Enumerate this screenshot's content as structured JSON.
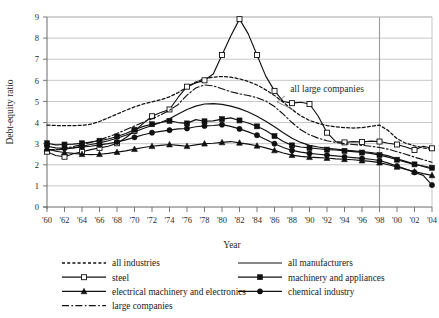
{
  "chart_data": {
    "type": "line",
    "title": "",
    "xlabel": "Year",
    "ylabel": "Debt-equity ratio",
    "xlim": [
      1960,
      2004
    ],
    "ylim": [
      0,
      9
    ],
    "ytick_values": [
      0,
      1,
      2,
      3,
      4,
      5,
      6,
      7,
      8,
      9
    ],
    "ytick_labels": [
      "0",
      "1",
      "2",
      "3",
      "4",
      "5",
      "6",
      "7",
      "8",
      "9"
    ],
    "grid": "horizontal",
    "legend_position": "below-plot",
    "x": [
      1960,
      1961,
      1962,
      1963,
      1964,
      1965,
      1966,
      1967,
      1968,
      1969,
      1970,
      1971,
      1972,
      1973,
      1974,
      1975,
      1976,
      1977,
      1978,
      1979,
      1980,
      1981,
      1982,
      1983,
      1984,
      1985,
      1986,
      1987,
      1988,
      1989,
      1990,
      1991,
      1992,
      1993,
      1994,
      1995,
      1996,
      1997,
      1998,
      1999,
      2000,
      2001,
      2002,
      2003,
      2004
    ],
    "xtick_labels": [
      "'60",
      "'62",
      "'64",
      "'66",
      "'68",
      "'70",
      "'72",
      "'74",
      "'76",
      "'78",
      "'80",
      "'82",
      "'84",
      "'86",
      "'88",
      "'90",
      "'92",
      "'94",
      "'96",
      "'98",
      "'00",
      "'02",
      "'04"
    ],
    "annotations": [
      {
        "text": "all large companies",
        "x": 1992,
        "y": 5.45,
        "points_to_x": 1988.2,
        "points_to_y": 4.6
      }
    ],
    "vertical_line": {
      "x": 1998,
      "label": "1998"
    },
    "series": [
      {
        "name": "all industries",
        "style": "dotted",
        "marker": "none",
        "color": "#111111",
        "values": [
          3.88,
          3.86,
          3.85,
          3.85,
          3.87,
          3.92,
          4.05,
          4.22,
          4.4,
          4.58,
          4.74,
          4.88,
          4.98,
          5.08,
          5.22,
          5.42,
          5.68,
          5.92,
          6.08,
          6.15,
          6.18,
          6.15,
          6.07,
          5.95,
          5.78,
          5.55,
          5.28,
          4.96,
          4.62,
          4.32,
          4.1,
          3.96,
          3.86,
          3.8,
          3.76,
          3.74,
          3.76,
          3.82,
          3.88,
          3.62,
          3.24,
          3.02,
          2.9,
          2.8,
          2.72
        ]
      },
      {
        "name": "all manufacturers",
        "style": "solid",
        "marker": "none",
        "color": "#111111",
        "values": [
          2.72,
          2.7,
          2.74,
          2.8,
          2.88,
          2.96,
          3.04,
          3.14,
          3.26,
          3.4,
          3.56,
          3.72,
          3.86,
          4.0,
          4.18,
          4.4,
          4.62,
          4.78,
          4.88,
          4.9,
          4.86,
          4.78,
          4.66,
          4.5,
          4.3,
          4.06,
          3.8,
          3.52,
          3.26,
          3.06,
          2.92,
          2.84,
          2.78,
          2.74,
          2.7,
          2.66,
          2.62,
          2.58,
          2.52,
          2.42,
          2.28,
          2.16,
          2.04,
          1.92,
          1.8
        ]
      },
      {
        "name": "steel",
        "style": "solid",
        "marker": "open-square",
        "color": "#111111",
        "values": [
          2.62,
          2.44,
          2.38,
          2.52,
          2.62,
          2.72,
          2.8,
          2.88,
          3.02,
          3.28,
          3.6,
          3.96,
          4.3,
          4.48,
          4.62,
          5.2,
          5.7,
          5.88,
          6.0,
          6.3,
          7.2,
          8.1,
          8.9,
          8.2,
          7.2,
          6.2,
          5.5,
          5.0,
          4.92,
          4.96,
          4.88,
          4.3,
          3.52,
          3.1,
          3.06,
          3.1,
          3.08,
          3.12,
          3.1,
          3.02,
          2.96,
          2.84,
          2.7,
          2.88,
          2.78
        ]
      },
      {
        "name": "machinery and appliances",
        "style": "solid",
        "marker": "filled-square",
        "color": "#111111",
        "values": [
          3.02,
          2.94,
          2.96,
          2.98,
          3.02,
          3.08,
          3.14,
          3.22,
          3.34,
          3.48,
          3.66,
          3.82,
          3.92,
          4.0,
          4.08,
          4.0,
          3.96,
          4.14,
          4.06,
          4.08,
          4.16,
          4.22,
          4.1,
          3.98,
          3.82,
          3.62,
          3.36,
          3.1,
          2.92,
          2.84,
          2.8,
          2.76,
          2.72,
          2.7,
          2.66,
          2.62,
          2.58,
          2.54,
          2.46,
          2.36,
          2.24,
          2.12,
          2.02,
          1.94,
          1.86
        ]
      },
      {
        "name": "electrical machinery and electronics",
        "style": "solid",
        "marker": "filled-triangle",
        "color": "#111111",
        "values": [
          2.76,
          2.64,
          2.58,
          2.54,
          2.5,
          2.48,
          2.5,
          2.54,
          2.6,
          2.66,
          2.74,
          2.82,
          2.88,
          2.92,
          2.96,
          2.92,
          2.88,
          2.94,
          3.0,
          3.02,
          3.06,
          3.1,
          3.04,
          2.98,
          2.9,
          2.8,
          2.68,
          2.56,
          2.46,
          2.4,
          2.36,
          2.34,
          2.32,
          2.28,
          2.26,
          2.24,
          2.2,
          2.16,
          2.1,
          2.0,
          1.9,
          1.78,
          1.68,
          1.58,
          1.5
        ]
      },
      {
        "name": "chemical industry",
        "style": "solid",
        "marker": "filled-circle",
        "color": "#111111",
        "values": [
          2.88,
          2.8,
          2.78,
          2.8,
          2.84,
          2.88,
          2.94,
          3.0,
          3.08,
          3.18,
          3.3,
          3.42,
          3.52,
          3.58,
          3.64,
          3.7,
          3.72,
          3.8,
          3.84,
          3.86,
          3.9,
          3.82,
          3.7,
          3.56,
          3.4,
          3.2,
          3.0,
          2.82,
          2.68,
          2.6,
          2.54,
          2.5,
          2.46,
          2.42,
          2.38,
          2.34,
          2.3,
          2.26,
          2.2,
          2.08,
          1.94,
          1.8,
          1.64,
          1.5,
          1.04
        ]
      },
      {
        "name": "large companies",
        "style": "dash-dot",
        "marker": "none",
        "color": "#111111",
        "values": [
          2.7,
          2.72,
          2.78,
          2.86,
          2.96,
          3.06,
          3.18,
          3.32,
          3.48,
          3.66,
          3.84,
          4.02,
          4.18,
          4.36,
          4.58,
          4.86,
          5.3,
          5.64,
          5.78,
          5.74,
          5.6,
          5.46,
          5.36,
          5.28,
          5.18,
          5.02,
          4.76,
          4.4,
          4.0,
          3.66,
          3.42,
          3.26,
          3.14,
          3.06,
          3.0,
          2.96,
          2.92,
          2.88,
          2.82,
          2.74,
          2.62,
          2.5,
          2.36,
          2.24,
          2.12
        ]
      }
    ]
  },
  "legend": {
    "items": [
      {
        "label": "all industries",
        "style": "dotted",
        "marker": "none",
        "col": 0,
        "row": 0
      },
      {
        "label": "all manufacturers",
        "style": "solid",
        "marker": "none",
        "col": 1,
        "row": 0
      },
      {
        "label": "steel",
        "style": "solid",
        "marker": "open-square",
        "col": 0,
        "row": 1
      },
      {
        "label": "machinery and appliances",
        "style": "solid",
        "marker": "filled-square",
        "col": 1,
        "row": 1
      },
      {
        "label": "electrical machinery and electronics",
        "style": "solid",
        "marker": "filled-triangle",
        "col": 0,
        "row": 2
      },
      {
        "label": "chemical industry",
        "style": "solid",
        "marker": "filled-circle",
        "col": 1,
        "row": 2
      },
      {
        "label": "large companies",
        "style": "dash-dot",
        "marker": "none",
        "col": 0,
        "row": 3
      }
    ]
  },
  "colors": {
    "ink": "#111111",
    "axis": "#6b6b6b",
    "grid": "#b9b9b9",
    "background": "#ffffff"
  }
}
